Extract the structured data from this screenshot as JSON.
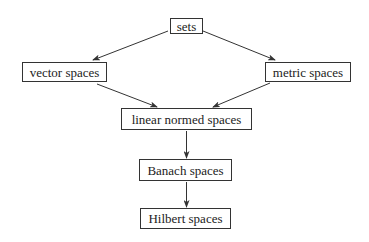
{
  "diagram": {
    "type": "hierarchy",
    "nodes": {
      "sets": "sets",
      "vector": "vector spaces",
      "metric": "metric spaces",
      "linear": "linear normed spaces",
      "banach": "Banach spaces",
      "hilbert": "Hilbert spaces"
    },
    "edges": [
      [
        "sets",
        "vector spaces"
      ],
      [
        "sets",
        "metric spaces"
      ],
      [
        "vector spaces",
        "linear normed spaces"
      ],
      [
        "metric spaces",
        "linear normed spaces"
      ],
      [
        "linear normed spaces",
        "Banach spaces"
      ],
      [
        "Banach spaces",
        "Hilbert spaces"
      ]
    ]
  }
}
